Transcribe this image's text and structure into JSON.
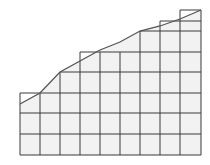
{
  "diagram": {
    "type": "area-under-curve-grid",
    "colors": {
      "grid": "#3a3a3a",
      "curve": "#555555",
      "fill": "#f2f2f2",
      "background": "#ffffff"
    },
    "baseline_y": 155,
    "columns": [
      {
        "x0": 20,
        "x1": 40,
        "top": 93
      },
      {
        "x0": 40,
        "x1": 60,
        "top": 93
      },
      {
        "x0": 60,
        "x1": 80,
        "top": 72
      },
      {
        "x0": 80,
        "x1": 100,
        "top": 52
      },
      {
        "x0": 100,
        "x1": 120,
        "top": 52
      },
      {
        "x0": 120,
        "x1": 140,
        "top": 52
      },
      {
        "x0": 140,
        "x1": 160,
        "top": 31
      },
      {
        "x0": 160,
        "x1": 180,
        "top": 21
      },
      {
        "x0": 180,
        "x1": 201,
        "top": 10
      }
    ],
    "horizontal_lines_y": [
      10,
      21,
      31,
      52,
      72,
      93,
      113,
      134,
      155
    ],
    "curve_points": [
      [
        20,
        104
      ],
      [
        40,
        93
      ],
      [
        60,
        72
      ],
      [
        80,
        61
      ],
      [
        100,
        50
      ],
      [
        120,
        42
      ],
      [
        140,
        31
      ],
      [
        160,
        26
      ],
      [
        180,
        19
      ],
      [
        201,
        10
      ]
    ]
  }
}
